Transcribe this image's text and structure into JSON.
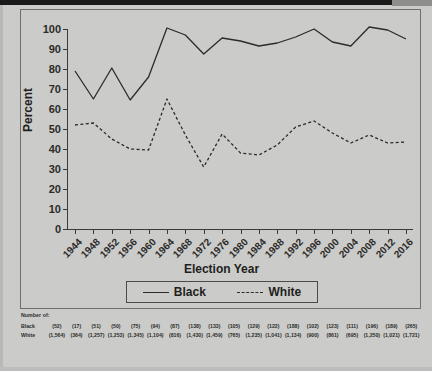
{
  "chart_data": {
    "type": "line",
    "title": "",
    "xlabel": "Election Year",
    "ylabel": "Percent",
    "ylim": [
      0,
      100
    ],
    "ytick_step": 10,
    "yticks": [
      0,
      10,
      20,
      30,
      40,
      50,
      60,
      70,
      80,
      90,
      100
    ],
    "grid": false,
    "legend_position": "below-axis",
    "categories": [
      "1944",
      "1948",
      "1952",
      "1956",
      "1960",
      "1964",
      "1968",
      "1972",
      "1976",
      "1980",
      "1984",
      "1988",
      "1992",
      "1996",
      "2000",
      "2004",
      "2008",
      "2012",
      "2016"
    ],
    "series": [
      {
        "name": "Black",
        "style": "solid",
        "color": "#2b2b29",
        "values": [
          79,
          65,
          80.5,
          64.5,
          76,
          100.5,
          97,
          87.5,
          95.5,
          94,
          91.5,
          93,
          96,
          100,
          93.5,
          91.5,
          101,
          99.5,
          95
        ]
      },
      {
        "name": "White",
        "style": "dashed",
        "color": "#2b2b29",
        "values": [
          52,
          53,
          45,
          40,
          39.5,
          65,
          47,
          31,
          47.5,
          38,
          37,
          42,
          51,
          54,
          48,
          43,
          47,
          43,
          43.5
        ]
      }
    ]
  },
  "axis": {
    "y_title": "Percent",
    "x_title": "Election Year"
  },
  "legend": {
    "entries": [
      {
        "label": "Black",
        "style": "solid"
      },
      {
        "label": "White",
        "style": "dashed"
      }
    ]
  },
  "footnote": {
    "title": "Number of:",
    "rows": [
      {
        "label": "Black",
        "values": [
          "(52)",
          "(17)",
          "(51)",
          "(50)",
          "(75)",
          "(94)",
          "(87)",
          "(138)",
          "(133)",
          "(105)",
          "(129)",
          "(122)",
          "(188)",
          "(102)",
          "(123)",
          "(111)",
          "(196)",
          "(189)",
          "(265)"
        ]
      },
      {
        "label": "White",
        "values": [
          "(1,564)",
          "(364)",
          "(1,257)",
          "(1,253)",
          "(1,345)",
          "(1,104)",
          "(816)",
          "(1,430)",
          "(1,459)",
          "(765)",
          "(1,235)",
          "(1,041)",
          "(1,134)",
          "(900)",
          "(861)",
          "(695)",
          "(1,250)",
          "(1,021)",
          "(1,721)"
        ]
      }
    ]
  }
}
